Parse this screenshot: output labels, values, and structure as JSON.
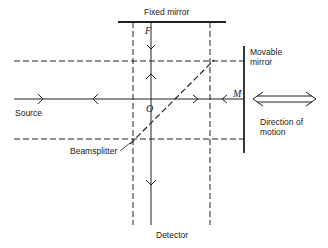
{
  "diagram": {
    "labels": {
      "fixed_mirror": "Fixed mirror",
      "movable_mirror_line1": "Movable",
      "movable_mirror_line2": "mirror",
      "source": "Source",
      "beamsplitter": "Beamsplitter",
      "detector": "Detector",
      "direction_line1": "Direction of",
      "direction_line2": "motion",
      "point_F": "F",
      "point_O": "O",
      "point_M": "M"
    },
    "colors": {
      "line": "#222222",
      "background": "#ffffff"
    }
  }
}
